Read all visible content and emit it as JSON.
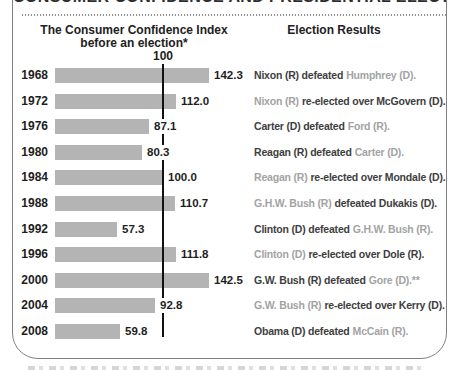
{
  "frame": {
    "title_partial": "CONSUMER CONFIDENCE AND PRESIDENTIAL ELECTIONS"
  },
  "headers": {
    "left_line1": "The Consumer Confidence Index",
    "left_line2": "before an election*",
    "right": "Election Results",
    "reference_label": "100"
  },
  "chart_data": {
    "type": "bar",
    "orientation": "horizontal",
    "title": "The Consumer Confidence Index before an election*",
    "right_column_title": "Election Results",
    "reference_line": 100,
    "xlim": [
      0,
      150
    ],
    "grid": false,
    "bar_color": "#b4b4b4",
    "reference_line_color": "#111111",
    "incumbent_party_text_color": "#a3a3a3",
    "main_text_color": "#3e3e3e",
    "categories": [
      "1968",
      "1972",
      "1976",
      "1980",
      "1984",
      "1988",
      "1992",
      "1996",
      "2000",
      "2004",
      "2008"
    ],
    "values": [
      142.3,
      112.0,
      87.1,
      80.3,
      100.0,
      110.7,
      57.3,
      111.8,
      142.5,
      92.8,
      59.8
    ],
    "rows": [
      {
        "year": "1968",
        "value": "142.3",
        "num": 142.3,
        "segments": [
          {
            "text": "Nixon (R) defeated",
            "tone": "dark"
          },
          {
            "text": "Humphrey (D).",
            "tone": "gray"
          }
        ]
      },
      {
        "year": "1972",
        "value": "112.0",
        "num": 112.0,
        "segments": [
          {
            "text": "Nixon (R)",
            "tone": "gray"
          },
          {
            "text": "re-elected over McGovern (D).",
            "tone": "dark"
          }
        ]
      },
      {
        "year": "1976",
        "value": "87.1",
        "num": 87.1,
        "segments": [
          {
            "text": "Carter (D) defeated",
            "tone": "dark"
          },
          {
            "text": "Ford (R).",
            "tone": "gray"
          }
        ]
      },
      {
        "year": "1980",
        "value": "80.3",
        "num": 80.3,
        "segments": [
          {
            "text": "Reagan (R) defeated",
            "tone": "dark"
          },
          {
            "text": "Carter (D).",
            "tone": "gray"
          }
        ]
      },
      {
        "year": "1984",
        "value": "100.0",
        "num": 100.0,
        "segments": [
          {
            "text": "Reagan (R)",
            "tone": "gray"
          },
          {
            "text": "re-elected over Mondale (D).",
            "tone": "dark"
          }
        ]
      },
      {
        "year": "1988",
        "value": "110.7",
        "num": 110.7,
        "segments": [
          {
            "text": "G.H.W. Bush (R)",
            "tone": "gray"
          },
          {
            "text": "defeated Dukakis (D).",
            "tone": "dark"
          }
        ]
      },
      {
        "year": "1992",
        "value": "57.3",
        "num": 57.3,
        "segments": [
          {
            "text": "Clinton (D) defeated",
            "tone": "dark"
          },
          {
            "text": "G.H.W. Bush (R).",
            "tone": "gray"
          }
        ]
      },
      {
        "year": "1996",
        "value": "111.8",
        "num": 111.8,
        "segments": [
          {
            "text": "Clinton (D)",
            "tone": "gray"
          },
          {
            "text": "re-elected over Dole (R).",
            "tone": "dark"
          }
        ]
      },
      {
        "year": "2000",
        "value": "142.5",
        "num": 142.5,
        "segments": [
          {
            "text": "G.W. Bush (R) defeated",
            "tone": "dark"
          },
          {
            "text": "Gore (D).**",
            "tone": "gray"
          }
        ]
      },
      {
        "year": "2004",
        "value": "92.8",
        "num": 92.8,
        "segments": [
          {
            "text": "G.W. Bush (R)",
            "tone": "gray"
          },
          {
            "text": "re-elected over Kerry (D).",
            "tone": "dark"
          }
        ]
      },
      {
        "year": "2008",
        "value": "59.8",
        "num": 59.8,
        "segments": [
          {
            "text": "Obama (D) defeated",
            "tone": "dark"
          },
          {
            "text": "McCain (R).",
            "tone": "gray"
          }
        ]
      }
    ]
  }
}
